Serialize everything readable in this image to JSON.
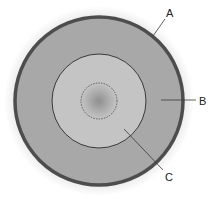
{
  "diagram": {
    "center": {
      "x": 99,
      "y": 101
    },
    "layers": [
      {
        "id": "A",
        "name": "outer-shell",
        "radius": 85,
        "stroke_width": 3.5,
        "fill": "#a6a6a6",
        "stroke": "#4d4d4d"
      },
      {
        "id": "B",
        "name": "middle-layer",
        "radius": 83,
        "fill": "#a8a8a8"
      },
      {
        "id": "C",
        "name": "inner-layer",
        "radius": 47,
        "fill": "#c4c4c4",
        "stroke": "#3a3a3a"
      },
      {
        "id": "core",
        "name": "core",
        "radius": 18,
        "dashed": true,
        "stroke": "#444444"
      }
    ],
    "labels": [
      {
        "text": "A",
        "x": 166,
        "y": 17,
        "line": {
          "x1": 153,
          "y1": 36,
          "x2": 165,
          "y2": 19
        }
      },
      {
        "text": "B",
        "x": 199,
        "y": 105,
        "line": {
          "x1": 161,
          "y1": 100,
          "x2": 196,
          "y2": 100
        }
      },
      {
        "text": "C",
        "x": 165,
        "y": 181,
        "line": {
          "x1": 124,
          "y1": 129,
          "x2": 163,
          "y2": 170
        }
      }
    ],
    "colors": {
      "background": "#ffffff",
      "outer_ring": "#4d4d4d",
      "middle_fill": "#a8a8a8",
      "inner_fill": "#c4c4c4",
      "core_center": "#8f8f8f",
      "line": "#3a3a3a",
      "text": "#222222"
    }
  }
}
